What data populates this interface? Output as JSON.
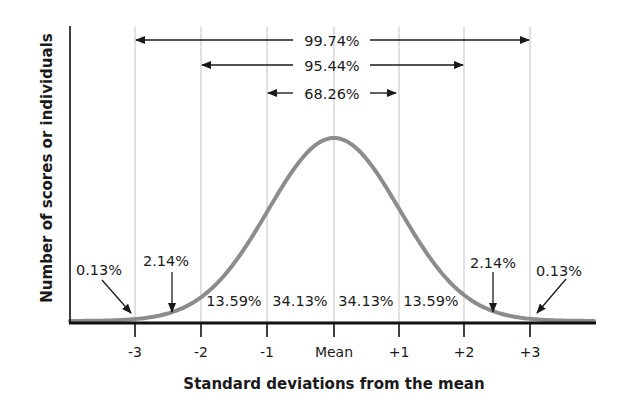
{
  "chart_data": {
    "type": "line",
    "title": "",
    "xlabel": "Standard deviations from the mean",
    "ylabel": "Number of scores or individuals",
    "x_ticks": [
      "-3",
      "-2",
      "-1",
      "Mean",
      "+1",
      "+2",
      "+3"
    ],
    "x_values": [
      -3,
      -2,
      -1,
      0,
      1,
      2,
      3
    ],
    "xlim": [
      -4,
      4
    ],
    "grid": "vertical lines at each standard deviation",
    "legend": "none",
    "curve": "normal distribution (bell curve)",
    "range_annotations": [
      {
        "label": "99.74%",
        "from": -3,
        "to": 3
      },
      {
        "label": "95.44%",
        "from": -2,
        "to": 2
      },
      {
        "label": "68.26%",
        "from": -1,
        "to": 1
      }
    ],
    "segment_percentages": [
      {
        "range": "below -3",
        "label": "0.13%",
        "value": 0.13
      },
      {
        "range": "-3 to -2",
        "label": "2.14%",
        "value": 2.14
      },
      {
        "range": "-2 to -1",
        "label": "13.59%",
        "value": 13.59
      },
      {
        "range": "-1 to Mean",
        "label": "34.13%",
        "value": 34.13
      },
      {
        "range": "Mean to +1",
        "label": "34.13%",
        "value": 34.13
      },
      {
        "range": "+1 to +2",
        "label": "13.59%",
        "value": 13.59
      },
      {
        "range": "+2 to +3",
        "label": "2.14%",
        "value": 2.14
      },
      {
        "range": "above +3",
        "label": "0.13%",
        "value": 0.13
      }
    ],
    "colors": {
      "curve": "#8c8c8c",
      "axis": "#111111",
      "grid": "#cfcfcf",
      "arrows": "#1a1a1a"
    }
  }
}
